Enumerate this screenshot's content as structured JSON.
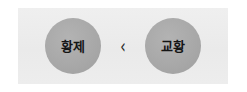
{
  "figure": {
    "panel_background": "#ececec",
    "page_background": "#ffffff",
    "node_color": "#a9a9a9",
    "text_color": "#151515",
    "left_node": {
      "label": "황제",
      "name": "node-emperor"
    },
    "relation": {
      "symbol": "‹",
      "name": "less-than-chevron"
    },
    "right_node": {
      "label": "교황",
      "name": "node-pope"
    }
  }
}
